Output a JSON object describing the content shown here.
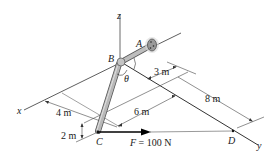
{
  "diagram": {
    "type": "3d-statics-pipe",
    "points": {
      "A": "A",
      "B": "B",
      "C": "C",
      "D": "D"
    },
    "axes": {
      "x": "x",
      "y": "y",
      "z": "z"
    },
    "angle": "θ",
    "dimensions": {
      "d3": "3 m",
      "d8": "8 m",
      "d6": "6 m",
      "d4": "4 m",
      "d2": "2 m"
    },
    "force": {
      "label": "F = 100 N",
      "symbol": "F",
      "value": "100 N"
    },
    "colors": {
      "line": "#333333",
      "pipe_fill": "#b8b8b8",
      "pipe_edge": "#555555",
      "force_arrow": "#000000",
      "flange": "#8a8a8a"
    }
  }
}
